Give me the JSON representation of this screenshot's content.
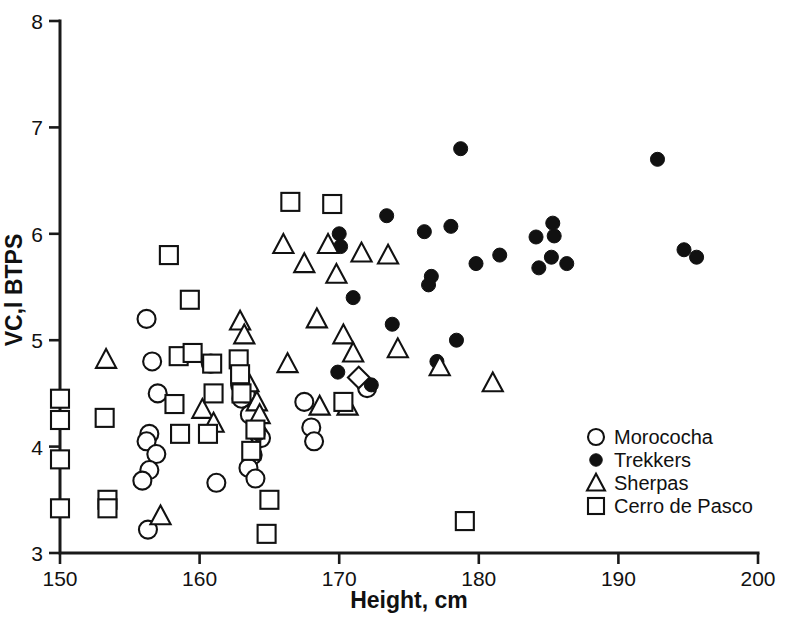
{
  "chart_data": {
    "type": "scatter",
    "title": "",
    "xlabel": "Height, cm",
    "ylabel": "VC,l BTPS",
    "xlim": [
      150,
      200
    ],
    "ylim": [
      3,
      8
    ],
    "xticks": [
      150,
      160,
      170,
      180,
      190,
      200
    ],
    "yticks": [
      3,
      4,
      5,
      6,
      7,
      8
    ],
    "grid": false,
    "legend_position": "lower-right",
    "series": [
      {
        "name": "Morococha",
        "marker": "open-circle",
        "color": "#111111",
        "points": [
          [
            156.2,
            5.2
          ],
          [
            156.6,
            4.8
          ],
          [
            157.0,
            4.5
          ],
          [
            156.4,
            4.12
          ],
          [
            156.2,
            4.05
          ],
          [
            156.9,
            3.93
          ],
          [
            156.4,
            3.78
          ],
          [
            155.9,
            3.68
          ],
          [
            156.3,
            3.22
          ],
          [
            160.8,
            4.78
          ],
          [
            161.2,
            3.66
          ],
          [
            162.9,
            4.58
          ],
          [
            163.0,
            4.45
          ],
          [
            163.3,
            4.5
          ],
          [
            163.6,
            4.3
          ],
          [
            163.8,
            3.92
          ],
          [
            163.5,
            3.8
          ],
          [
            164.0,
            3.7
          ],
          [
            164.2,
            4.12
          ],
          [
            164.4,
            4.08
          ],
          [
            167.5,
            4.42
          ],
          [
            168.0,
            4.18
          ],
          [
            168.2,
            4.05
          ],
          [
            172.0,
            4.55
          ]
        ]
      },
      {
        "name": "Trekkers",
        "marker": "filled-circle",
        "color": "#111111",
        "points": [
          [
            164.2,
            4.12
          ],
          [
            170.0,
            6.0
          ],
          [
            170.1,
            5.88
          ],
          [
            169.9,
            4.7
          ],
          [
            171.0,
            5.4
          ],
          [
            172.3,
            4.58
          ],
          [
            173.4,
            6.17
          ],
          [
            173.8,
            5.15
          ],
          [
            176.1,
            6.02
          ],
          [
            176.6,
            5.6
          ],
          [
            176.4,
            5.52
          ],
          [
            177.0,
            4.8
          ],
          [
            178.0,
            6.07
          ],
          [
            178.7,
            6.8
          ],
          [
            178.4,
            5.0
          ],
          [
            179.8,
            5.72
          ],
          [
            181.5,
            5.8
          ],
          [
            184.1,
            5.97
          ],
          [
            184.3,
            5.68
          ],
          [
            185.3,
            6.1
          ],
          [
            185.4,
            5.98
          ],
          [
            185.2,
            5.78
          ],
          [
            186.3,
            5.72
          ],
          [
            192.8,
            6.7
          ],
          [
            194.7,
            5.85
          ],
          [
            195.6,
            5.78
          ]
        ]
      },
      {
        "name": "Sherpas",
        "marker": "open-triangle",
        "color": "#111111",
        "points": [
          [
            153.3,
            4.82
          ],
          [
            157.2,
            3.35
          ],
          [
            160.2,
            4.35
          ],
          [
            161.0,
            4.22
          ],
          [
            162.9,
            5.18
          ],
          [
            163.2,
            5.05
          ],
          [
            163.5,
            4.6
          ],
          [
            164.1,
            4.42
          ],
          [
            164.3,
            4.3
          ],
          [
            166.0,
            5.9
          ],
          [
            166.3,
            4.78
          ],
          [
            167.5,
            5.72
          ],
          [
            168.4,
            5.2
          ],
          [
            168.6,
            4.38
          ],
          [
            169.2,
            5.9
          ],
          [
            169.8,
            5.62
          ],
          [
            170.3,
            5.05
          ],
          [
            170.6,
            4.38
          ],
          [
            171.0,
            4.88
          ],
          [
            171.6,
            5.82
          ],
          [
            173.5,
            5.8
          ],
          [
            174.2,
            4.92
          ],
          [
            177.2,
            4.75
          ],
          [
            181.0,
            4.6
          ]
        ]
      },
      {
        "name": "Cerro de Pasco",
        "marker": "open-square",
        "color": "#111111",
        "points": [
          [
            150.0,
            4.45
          ],
          [
            150.0,
            4.25
          ],
          [
            150.0,
            3.88
          ],
          [
            150.0,
            3.42
          ],
          [
            153.2,
            4.27
          ],
          [
            153.4,
            3.5
          ],
          [
            153.4,
            3.42
          ],
          [
            157.8,
            5.8
          ],
          [
            159.3,
            5.38
          ],
          [
            158.5,
            4.85
          ],
          [
            159.5,
            4.88
          ],
          [
            158.2,
            4.4
          ],
          [
            158.6,
            4.12
          ],
          [
            160.9,
            4.78
          ],
          [
            161.0,
            4.5
          ],
          [
            160.6,
            4.12
          ],
          [
            162.8,
            4.82
          ],
          [
            162.9,
            4.68
          ],
          [
            163.0,
            4.5
          ],
          [
            163.7,
            3.96
          ],
          [
            164.0,
            4.16
          ],
          [
            164.8,
            3.18
          ],
          [
            165.0,
            3.5
          ],
          [
            166.5,
            6.3
          ],
          [
            169.5,
            6.28
          ],
          [
            170.3,
            4.42
          ],
          [
            179.0,
            3.3
          ]
        ]
      },
      {
        "name": "unlabeled-diamond",
        "marker": "open-diamond",
        "color": "#111111",
        "points": [
          [
            171.4,
            4.65
          ]
        ]
      }
    ]
  },
  "legend": {
    "items": [
      {
        "label": "Morococha",
        "marker": "open-circle"
      },
      {
        "label": "Trekkers",
        "marker": "filled-circle"
      },
      {
        "label": "Sherpas",
        "marker": "open-triangle"
      },
      {
        "label": "Cerro de Pasco",
        "marker": "open-square"
      }
    ]
  },
  "axes": {
    "x_title": "Height, cm",
    "y_title": "VC,l BTPS",
    "x_tick_labels": [
      "150",
      "160",
      "170",
      "180",
      "190",
      "200"
    ],
    "y_tick_labels": [
      "3",
      "4",
      "5",
      "6",
      "7",
      "8"
    ]
  }
}
